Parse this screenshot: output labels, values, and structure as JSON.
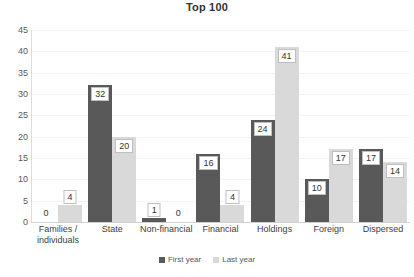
{
  "chart_data": {
    "type": "bar",
    "title": "Top 100",
    "xlabel": "",
    "ylabel": "",
    "ylim": [
      0,
      45
    ],
    "ytick_step": 5,
    "yticks": [
      "45",
      "40",
      "35",
      "30",
      "25",
      "20",
      "15",
      "10",
      "5",
      "0"
    ],
    "grid": true,
    "legend_position": "bottom",
    "categories": [
      "Families / individuals",
      "State",
      "Non-financial",
      "Financial",
      "Holdings",
      "Foreign",
      "Dispersed"
    ],
    "category_lines": [
      [
        "Families /",
        "individuals"
      ],
      [
        "State"
      ],
      [
        "Non-financial"
      ],
      [
        "Financial"
      ],
      [
        "Holdings"
      ],
      [
        "Foreign"
      ],
      [
        "Dispersed"
      ]
    ],
    "series": [
      {
        "name": "First year",
        "color": "#595959",
        "values": [
          0,
          32,
          1,
          16,
          24,
          10,
          17
        ]
      },
      {
        "name": "Last year",
        "color": "#d9d9d9",
        "values": [
          4,
          20,
          0,
          4,
          41,
          17,
          14
        ]
      }
    ]
  },
  "legend": {
    "items": [
      {
        "label": "First year",
        "color": "#595959"
      },
      {
        "label": "Last year",
        "color": "#d9d9d9"
      }
    ]
  },
  "colors": {
    "first_year": "#595959",
    "last_year": "#d9d9d9",
    "gridline": "#f2f2f2",
    "text": "#404040"
  }
}
